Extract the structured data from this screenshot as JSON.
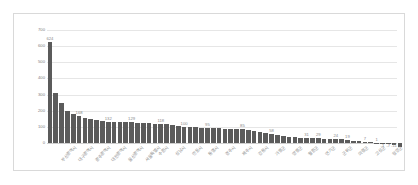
{
  "chart_data": {
    "type": "bar",
    "title": "",
    "subtitle": "",
    "xlabel": "",
    "ylabel": "",
    "ylim": [
      0,
      700
    ],
    "yticks": [
      0,
      100,
      200,
      300,
      400,
      500,
      600,
      700
    ],
    "ytick_labels": [
      "0",
      "100",
      "200",
      "300",
      "400",
      "500",
      "600",
      "700"
    ],
    "grid": true,
    "legend": false,
    "legend_position": "none",
    "series_name": "",
    "bar_color": "#5b5b5b",
    "grid_color": "#e6e6e6",
    "frame_color": "#d9d9d9",
    "label_color": "#8a8a8a",
    "categories": [
      "부산광역시",
      "대구광역시",
      "광주광역시",
      "대전광역시",
      "울산광역시",
      "서울특별시",
      "수원시",
      "성남시",
      "고양시",
      "용인시",
      "청주시",
      "전주시",
      "천안시",
      "창원시",
      "김해시",
      "포항시",
      "구미시",
      "진주시",
      "원주시",
      "춘천시",
      "강릉시",
      "목포시",
      "여수시",
      "순천시",
      "군산시",
      "익산시",
      "경주시",
      "안동시",
      "통영시",
      "제주시",
      "서귀포시",
      "속초시",
      "동해시",
      "삼척시",
      "태백시",
      "정선군",
      "영월군",
      "평창군",
      "홍천군",
      "횡성군",
      "인천광역시",
      "경기도",
      "강원도",
      "충청북도",
      "충청남도",
      "전라북도",
      "전라남도",
      "경상북도",
      "경상남도",
      "제주특별자치도",
      "세종특별자치시",
      "연기군",
      "청양군",
      "금산군",
      "부여군",
      "서천군",
      "예산군",
      "홍성군",
      "태안군",
      "당진시"
    ],
    "values": [
      624,
      310,
      245,
      200,
      181,
      168,
      155,
      148,
      141,
      136,
      132,
      131,
      130,
      129,
      128,
      126,
      124,
      122,
      120,
      118,
      115,
      110,
      105,
      100,
      98,
      97,
      96,
      95,
      92,
      90,
      88,
      87,
      86,
      85,
      80,
      74,
      68,
      62,
      58,
      52,
      46,
      40,
      36,
      33,
      31,
      30,
      29,
      27,
      26,
      24,
      22,
      19,
      14,
      10,
      7,
      4,
      1,
      -1,
      -7,
      -11
    ],
    "visible_value_labels": [
      {
        "index": 0,
        "text": "624"
      },
      {
        "index": 5,
        "text": "168"
      },
      {
        "index": 10,
        "text": "132"
      },
      {
        "index": 14,
        "text": "129"
      },
      {
        "index": 19,
        "text": "118"
      },
      {
        "index": 23,
        "text": "100"
      },
      {
        "index": 27,
        "text": "95"
      },
      {
        "index": 33,
        "text": "85"
      },
      {
        "index": 38,
        "text": "58"
      },
      {
        "index": 44,
        "text": "31"
      },
      {
        "index": 46,
        "text": "29"
      },
      {
        "index": 49,
        "text": "24"
      },
      {
        "index": 51,
        "text": "19"
      },
      {
        "index": 54,
        "text": "7"
      },
      {
        "index": 56,
        "text": "1"
      },
      {
        "index": 57,
        "text": "-1"
      },
      {
        "index": 58,
        "text": "-7"
      },
      {
        "index": 59,
        "text": "-11"
      },
      {
        "index": 60,
        "text": "-26"
      },
      {
        "index": 61,
        "text": "-25"
      },
      {
        "index": 62,
        "text": "-21.6"
      }
    ],
    "trailing_values": [
      -26,
      -25,
      -21.6
    ],
    "trailing_categories": [
      "고흥군",
      "보성군",
      "화순군"
    ],
    "axis_labels_shown": [
      "부산광역시",
      "대구광역시",
      "광주광역시",
      "대전광역시",
      "울산광역시",
      "서울특별시",
      "수원시",
      "성남시",
      "안동시",
      "통영시",
      "경주시",
      "제주시",
      "강릉시",
      "가평군",
      "양평군",
      "철원군",
      "연기군",
      "군위군",
      "의령군",
      "고성군",
      "청양군"
    ]
  }
}
